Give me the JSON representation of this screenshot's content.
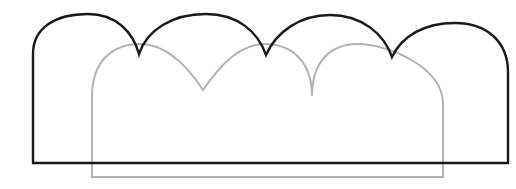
{
  "figure": {
    "canvas": {
      "width": 516,
      "height": 189,
      "background_color": "#ffffff"
    },
    "margin_band": {
      "name": "left gray margin band",
      "color": "#d4d4d4",
      "x": 0,
      "y": 0,
      "width": 21,
      "height": 164
    },
    "shapes": [
      {
        "id": "gray-arch-outline",
        "label": "Gray three-arch outline",
        "color": "#b3b3b3",
        "stroke_width": 2.0,
        "arch_count": 3,
        "cusp_count": 2,
        "left_edge_x": 92,
        "right_edge_x": 443,
        "baseline_y": 177,
        "peak_y": 44,
        "cusp_y": 90,
        "peaks_x": [
          140,
          265,
          392
        ],
        "cusps_x": [
          203,
          328
        ],
        "path": "M 92 177 L 92 96 C 92 62 112 44 140 44 C 166 44 186 64 203 90 C 221 64 240 44 265 44 C 292 44 312 62 312 96 C 312 62 330 44 358 44 C 386 44 443 66 443 104 L 443 177 Z"
      },
      {
        "id": "black-arch-outline",
        "label": "Black four-arch outline",
        "color": "#1a1a1a",
        "stroke_width": 2.4,
        "arch_count": 4,
        "cusp_count": 3,
        "left_edge_x": 33,
        "right_edge_x": 508,
        "baseline_y": 163,
        "peak_y": 14,
        "cusp_y": 54,
        "peaks_x": [
          88,
          206,
          330,
          455
        ],
        "cusps_x": [
          139,
          266,
          392
        ],
        "path": "M 33 163 L 33 54 C 33 28 55 14 88 14 C 116 14 133 32 139 54 C 147 30 172 14 206 14 C 238 14 258 32 266 55 C 276 32 300 15 330 15 C 362 15 384 34 392 57 C 402 36 424 23 455 23 C 487 23 508 42 508 72 L 508 163 Z"
      }
    ]
  }
}
